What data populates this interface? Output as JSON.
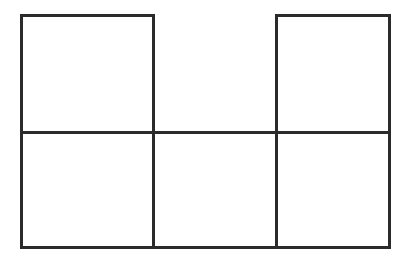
{
  "diagram": {
    "stroke_color": "#2b2b2b",
    "background": "#ffffff",
    "cells": [
      {
        "id": "top-left",
        "row": 0,
        "col": 0,
        "x": 20,
        "y": 14,
        "w": 135,
        "h": 120
      },
      {
        "id": "top-right",
        "row": 0,
        "col": 2,
        "x": 275,
        "y": 14,
        "w": 116,
        "h": 120
      },
      {
        "id": "bottom-left",
        "row": 1,
        "col": 0,
        "x": 20,
        "y": 131,
        "w": 135,
        "h": 118
      },
      {
        "id": "bottom-middle",
        "row": 1,
        "col": 1,
        "x": 152,
        "y": 131,
        "w": 126,
        "h": 118
      },
      {
        "id": "bottom-right",
        "row": 1,
        "col": 2,
        "x": 275,
        "y": 131,
        "w": 116,
        "h": 118
      }
    ]
  }
}
